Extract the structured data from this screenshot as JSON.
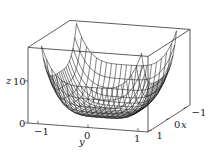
{
  "chart_data": {
    "type": "surface-wireframe-3d",
    "title": "",
    "function": "z = 9*(x^4 + y^4)",
    "xlabel": "x",
    "ylabel": "y",
    "zlabel": "z",
    "xlim": [
      -1.2,
      1.2
    ],
    "ylim": [
      -1.2,
      1.2
    ],
    "zlim": [
      0,
      18
    ],
    "x_ticks": [
      {
        "value": -1,
        "label": "−1"
      },
      {
        "value": 0,
        "label": "0"
      },
      {
        "value": 1,
        "label": "1"
      }
    ],
    "y_ticks": [
      {
        "value": -1,
        "label": "−1"
      },
      {
        "value": 0,
        "label": "0"
      },
      {
        "value": 1,
        "label": "1"
      }
    ],
    "z_ticks": [
      {
        "value": 0,
        "label": "0"
      },
      {
        "value": 10,
        "label": "10"
      }
    ],
    "grid_lines": 20,
    "grid_range": [
      -1,
      1
    ],
    "box": true,
    "line_color": "#1a1a1a",
    "box_color": "#333333"
  }
}
